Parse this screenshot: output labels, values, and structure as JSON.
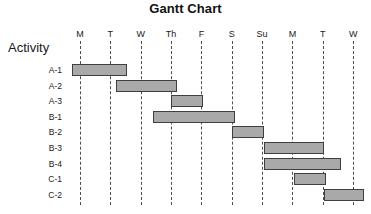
{
  "chart_data": {
    "type": "bar",
    "chart_variant": "gantt",
    "title": "Gantt Chart",
    "xlabel": "",
    "ylabel": "Activity",
    "grid": true,
    "legend": false,
    "x_tick_labels": [
      "M",
      "T",
      "W",
      "Th",
      "F",
      "S",
      "Su",
      "M",
      "T",
      "W"
    ],
    "x_tick_index": [
      0,
      1,
      2,
      3,
      4,
      5,
      6,
      7,
      8,
      9
    ],
    "xlim": [
      -0.25,
      9.25
    ],
    "categories": [
      "A-1",
      "A-2",
      "A-3",
      "B-1",
      "B-2",
      "B-3",
      "B-4",
      "C-1",
      "C-2"
    ],
    "bars": [
      {
        "label": "A-1",
        "start_day": -0.25,
        "end_day": 1.55,
        "duration_days": 1.8
      },
      {
        "label": "A-2",
        "start_day": 1.2,
        "end_day": 3.2,
        "duration_days": 2.0
      },
      {
        "label": "A-3",
        "start_day": 3.0,
        "end_day": 4.05,
        "duration_days": 1.05
      },
      {
        "label": "B-1",
        "start_day": 2.4,
        "end_day": 5.1,
        "duration_days": 2.7
      },
      {
        "label": "B-2",
        "start_day": 5.0,
        "end_day": 6.05,
        "duration_days": 1.05
      },
      {
        "label": "B-3",
        "start_day": 6.05,
        "end_day": 8.05,
        "duration_days": 2.0
      },
      {
        "label": "B-4",
        "start_day": 6.05,
        "end_day": 8.6,
        "duration_days": 2.55
      },
      {
        "label": "C-1",
        "start_day": 7.05,
        "end_day": 8.1,
        "duration_days": 1.05
      },
      {
        "label": "C-2",
        "start_day": 8.05,
        "end_day": 9.35,
        "duration_days": 1.3
      }
    ],
    "colors": {
      "bar_fill": "#a9a9a9",
      "bar_border": "#3f3f3f",
      "gridline": "#4d4d4d",
      "text": "#1a1a1a",
      "background": "#ffffff"
    }
  }
}
